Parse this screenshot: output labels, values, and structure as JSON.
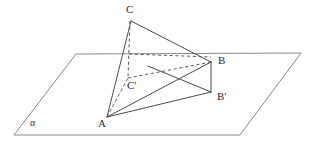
{
  "figure": {
    "kind": "solid-geometry-diagram",
    "stroke_color": "#4a4a4a",
    "dashed_color": "#4a4a4a",
    "background": "#ffffff",
    "width": 313,
    "height": 149
  },
  "plane": {
    "name": "alpha",
    "label": "α",
    "label_x": 30,
    "label_y": 126,
    "corners": [
      {
        "x": 76,
        "y": 54
      },
      {
        "x": 301,
        "y": 53
      },
      {
        "x": 240,
        "y": 135
      },
      {
        "x": 14,
        "y": 135
      }
    ]
  },
  "points": [
    {
      "id": "C",
      "label": "C",
      "x": 131,
      "y": 21,
      "label_x": 126,
      "label_y": 13
    },
    {
      "id": "B",
      "label": "B",
      "x": 211,
      "y": 62,
      "label_x": 218,
      "label_y": 64
    },
    {
      "id": "Cp",
      "label": "C′",
      "x": 128,
      "y": 77,
      "label_x": 127,
      "label_y": 89
    },
    {
      "id": "Bp",
      "label": "B′",
      "x": 211,
      "y": 92,
      "label_x": 217,
      "label_y": 100
    },
    {
      "id": "A",
      "label": "A",
      "x": 107,
      "y": 117,
      "label_x": 98,
      "label_y": 127
    }
  ],
  "solid_edges": [
    {
      "name": "edge-A-C",
      "x1": 107,
      "y1": 117,
      "x2": 131,
      "y2": 21
    },
    {
      "name": "edge-C-B",
      "x1": 131,
      "y1": 21,
      "x2": 211,
      "y2": 62
    },
    {
      "name": "edge-A-B",
      "x1": 107,
      "y1": 117,
      "x2": 211,
      "y2": 62
    },
    {
      "name": "edge-A-Bprime",
      "x1": 107,
      "y1": 117,
      "x2": 211,
      "y2": 92
    },
    {
      "name": "edge-B-Bprime",
      "x1": 211,
      "y1": 62,
      "x2": 211,
      "y2": 92
    },
    {
      "name": "edge-Bprime-inner",
      "x1": 211,
      "y1": 92,
      "x2": 148,
      "y2": 66
    }
  ],
  "dashed_edges": [
    {
      "name": "edge-C-Cprime",
      "x1": 130,
      "y1": 21,
      "x2": 128,
      "y2": 78
    },
    {
      "name": "edge-Cprime-B",
      "x1": 128,
      "y1": 78,
      "x2": 211,
      "y2": 62
    },
    {
      "name": "edge-A-Cprime",
      "x1": 107,
      "y1": 117,
      "x2": 128,
      "y2": 78
    },
    {
      "name": "edge-trace-horizontal",
      "x1": 129,
      "y1": 54,
      "x2": 211,
      "y2": 57
    }
  ]
}
